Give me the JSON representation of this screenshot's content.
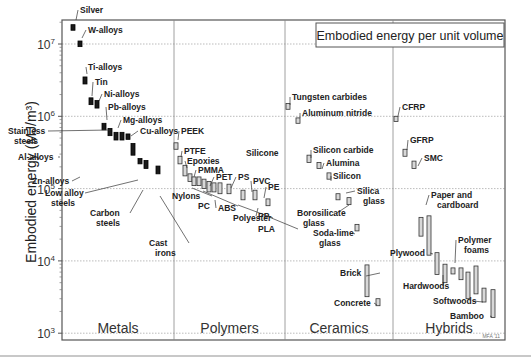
{
  "chart_data": {
    "type": "bar",
    "subtype": "log-range-bar",
    "title": "Embodied energy per unit volume",
    "ylabel": "Embodied energy (MJ/m³)",
    "xlabel": "",
    "yscale": "log",
    "ylim": [
      1000,
      20000000
    ],
    "yticks": [
      {
        "base": "10",
        "exp": "3",
        "value": 1000
      },
      {
        "base": "10",
        "exp": "4",
        "value": 10000
      },
      {
        "base": "10",
        "exp": "5",
        "value": 100000
      },
      {
        "base": "10",
        "exp": "6",
        "value": 1000000
      },
      {
        "base": "10",
        "exp": "7",
        "value": 10000000
      }
    ],
    "grid": true,
    "credit": "MFA '11",
    "categories": [
      "Metals",
      "Polymers",
      "Ceramics",
      "Hybrids"
    ],
    "series": [
      {
        "name": "Metals",
        "style": "solid",
        "materials": [
          {
            "label": "Silver",
            "x": 73,
            "lo": 15500000,
            "hi": 18500000,
            "lx": 80,
            "ly": 13,
            "tx": 76,
            "ty": 20
          },
          {
            "label": "W-alloys",
            "x": 80,
            "lo": 9200000,
            "hi": 11000000,
            "lx": 88,
            "ly": 33,
            "tx": 82,
            "ty": 38
          },
          {
            "label": "Ti-alloys",
            "x": 85,
            "lo": 2800000,
            "hi": 3500000,
            "lx": 88,
            "ly": 70,
            "tx": 87,
            "ty": 74
          },
          {
            "label": "Tin",
            "x": 91,
            "lo": 1450000,
            "hi": 1800000,
            "lx": 95,
            "ly": 85,
            "tx": 92,
            "ty": 96
          },
          {
            "label": "Ni-alloys",
            "x": 97,
            "lo": 1300000,
            "hi": 1650000,
            "lx": 104,
            "ly": 97,
            "tx": 99,
            "ty": 101
          },
          {
            "label": "Pb-alloys",
            "x": 104,
            "lo": 650000,
            "hi": 800000,
            "lx": 108,
            "ly": 110,
            "tx": 107,
            "ty": 120
          },
          {
            "label": "Stainless steels",
            "x": 110,
            "lo": 540000,
            "hi": 680000,
            "lx": 8,
            "ly": 134,
            "tx": 110,
            "ty": 130,
            "multiline": true
          },
          {
            "label": "Mg-alloys",
            "x": 116,
            "lo": 470000,
            "hi": 600000,
            "lx": 123,
            "ly": 123,
            "tx": 118,
            "ty": 128
          },
          {
            "label": "Al-alloys",
            "x": 122,
            "lo": 470000,
            "hi": 600000,
            "lx": 18,
            "ly": 160,
            "tx": 60,
            "ty": 157
          },
          {
            "label": "Cu-alloys",
            "x": 128,
            "lo": 480000,
            "hi": 570000,
            "lx": 140,
            "ly": 134,
            "tx": 131,
            "ty": 136
          },
          {
            "label": "Zn-alloys",
            "x": 133,
            "lo": 290000,
            "hi": 420000,
            "lx": 32,
            "ly": 184,
            "tx": 80,
            "ty": 177
          },
          {
            "label": "Low alloy steels",
            "x": 140,
            "lo": 220000,
            "hi": 260000,
            "lx": 45,
            "ly": 196,
            "tx": 138,
            "ty": 180,
            "multiline": true
          },
          {
            "label": "Carbon steels",
            "x": 146,
            "lo": 190000,
            "hi": 245000,
            "lx": 90,
            "ly": 216,
            "tx": 143,
            "ty": 190,
            "multiline": true
          },
          {
            "label": "Cast irons",
            "x": 158,
            "lo": 160000,
            "hi": 205000,
            "lx": 149,
            "ly": 246,
            "tx": 160,
            "ty": 196,
            "multiline": true
          }
        ]
      },
      {
        "name": "Polymers",
        "style": "hollow",
        "materials": [
          {
            "label": "PEEK",
            "x": 176,
            "lo": 350000,
            "hi": 430000,
            "lx": 181,
            "ly": 134,
            "tx": 178,
            "ty": 140
          },
          {
            "label": "PTFE",
            "x": 180,
            "lo": 220000,
            "hi": 280000,
            "lx": 184,
            "ly": 154,
            "tx": 181,
            "ty": 157
          },
          {
            "label": "Epoxies",
            "x": 185,
            "lo": 150000,
            "hi": 210000,
            "lx": 187,
            "ly": 164,
            "tx": 187,
            "ty": 168
          },
          {
            "label": "PMMA",
            "x": 190,
            "lo": 125000,
            "hi": 160000,
            "lx": 198,
            "ly": 173,
            "tx": 194,
            "ty": 177
          },
          {
            "label": "Nylons",
            "x": 194,
            "lo": 110000,
            "hi": 145000,
            "lx": 172,
            "ly": 199,
            "tx": 192,
            "ty": 188
          },
          {
            "label": "PC",
            "x": 199,
            "lo": 110000,
            "hi": 145000,
            "lx": 198,
            "ly": 209,
            "tx": 203,
            "ty": 191
          },
          {
            "label": "PET",
            "x": 204,
            "lo": 100000,
            "hi": 135000,
            "lx": 216,
            "ly": 180,
            "tx": 210,
            "ty": 186
          },
          {
            "label": "ABS",
            "x": 209,
            "lo": 90000,
            "hi": 125000,
            "lx": 218,
            "ly": 211,
            "tx": 215,
            "ty": 200
          },
          {
            "label": "PS",
            "x": 214,
            "lo": 90000,
            "hi": 120000,
            "lx": 238,
            "ly": 180,
            "tx": 231,
            "ty": 188
          },
          {
            "label": "Polyester",
            "x": 220,
            "lo": 85000,
            "hi": 120000,
            "lx": 233,
            "ly": 221,
            "tx": 238,
            "ty": 205
          },
          {
            "label": "PVC",
            "x": 229,
            "lo": 85000,
            "hi": 115000,
            "lx": 253,
            "ly": 184,
            "tx": 252,
            "ty": 192
          },
          {
            "label": "PP",
            "x": 243,
            "lo": 70000,
            "hi": 95000,
            "lx": 258,
            "ly": 219,
            "tx": 258,
            "ty": 208
          },
          {
            "label": "PE",
            "x": 255,
            "lo": 70000,
            "hi": 95000,
            "lx": 268,
            "ly": 190,
            "tx": 264,
            "ty": 198
          },
          {
            "label": "PLA",
            "x": 268,
            "lo": 58000,
            "hi": 72000,
            "lx": 258,
            "ly": 232,
            "tx": 269,
            "ty": 217
          },
          {
            "label": "Silicone",
            "x": 0,
            "lo": 0,
            "hi": 0,
            "lx": 246,
            "ly": 156,
            "tx": 0,
            "ty": 0,
            "nobar": true
          }
        ]
      },
      {
        "name": "Ceramics",
        "style": "hollow",
        "materials": [
          {
            "label": "Tungsten carbides",
            "x": 288,
            "lo": 1250000,
            "hi": 1500000,
            "lx": 292,
            "ly": 100,
            "tx": 290,
            "ty": 105
          },
          {
            "label": "Aluminum nitride",
            "x": 298,
            "lo": 800000,
            "hi": 950000,
            "lx": 302,
            "ly": 116,
            "tx": 300,
            "ty": 118
          },
          {
            "label": "Silicon carbide",
            "x": 309,
            "lo": 230000,
            "hi": 290000,
            "lx": 313,
            "ly": 153,
            "tx": 311,
            "ty": 158
          },
          {
            "label": "Alumina",
            "x": 319,
            "lo": 190000,
            "hi": 230000,
            "lx": 326,
            "ly": 166,
            "tx": 322,
            "ty": 169
          },
          {
            "label": "Silicon",
            "x": 329,
            "lo": 135000,
            "hi": 165000,
            "lx": 333,
            "ly": 179,
            "tx": 331,
            "ty": 181
          },
          {
            "label": "Silica glass",
            "x": 338,
            "lo": 70000,
            "hi": 85000,
            "lx": 357,
            "ly": 194,
            "tx": 346,
            "ty": 193,
            "multiline": true
          },
          {
            "label": "Borosilicate glass",
            "x": 349,
            "lo": 60000,
            "hi": 75000,
            "lx": 297,
            "ly": 216,
            "tx": 349,
            "ty": 205,
            "multiline": true
          },
          {
            "label": "Soda-lime glass",
            "x": 357,
            "lo": 26000,
            "hi": 32000,
            "lx": 313,
            "ly": 236,
            "tx": 355,
            "ty": 234,
            "multiline": true
          },
          {
            "label": "Brick",
            "x": 367,
            "lo": 3200000,
            "hi": 8800,
            "lx": 340,
            "ly": 276,
            "tx": 366,
            "ty": 276,
            "range": [
              3200,
              8800
            ]
          },
          {
            "label": "Concrete",
            "x": 378,
            "lo": 2400,
            "hi": 3000,
            "lx": 334,
            "ly": 306,
            "tx": 377,
            "ty": 305
          }
        ]
      },
      {
        "name": "Hybrids",
        "style": "hollow",
        "materials": [
          {
            "label": "CFRP",
            "x": 396,
            "lo": 850000,
            "hi": 1000000,
            "lx": 402,
            "ly": 110,
            "tx": 398,
            "ty": 116
          },
          {
            "label": "GFRP",
            "x": 405,
            "lo": 280000,
            "hi": 350000,
            "lx": 410,
            "ly": 143,
            "tx": 407,
            "ty": 150
          },
          {
            "label": "SMC",
            "x": 414,
            "lo": 190000,
            "hi": 240000,
            "lx": 424,
            "ly": 161,
            "tx": 418,
            "ty": 166
          },
          {
            "label": "Paper and cardboard",
            "x": 421,
            "lo": 22000,
            "hi": 40000,
            "lx": 431,
            "ly": 198,
            "tx": 426,
            "ty": 205,
            "multiline": true
          },
          {
            "label": "Paper and cardboard (2)",
            "x": 429,
            "lo": 12000,
            "hi": 42000,
            "lx": 0,
            "ly": 0,
            "tx": 0,
            "ty": 0,
            "nolabel": true
          },
          {
            "label": "Plywood",
            "x": 437,
            "lo": 6500,
            "hi": 13000,
            "lx": 390,
            "ly": 256,
            "tx": 433,
            "ty": 254
          },
          {
            "label": "Hardwoods",
            "x": 445,
            "lo": 5000,
            "hi": 9000,
            "lx": 403,
            "ly": 289,
            "tx": 443,
            "ty": 275
          },
          {
            "label": "Polymer foams",
            "x": 453,
            "lo": 6600,
            "hi": 8000,
            "lx": 458,
            "ly": 243,
            "tx": 455,
            "ty": 263,
            "multiline": true
          },
          {
            "label": "Polymer foams (2)",
            "x": 461,
            "lo": 5500,
            "hi": 8000,
            "lx": 0,
            "ly": 0,
            "tx": 0,
            "ty": 0,
            "nolabel": true
          },
          {
            "label": "Polymer foams (3)",
            "x": 468,
            "lo": 3000,
            "hi": 7000,
            "lx": 0,
            "ly": 0,
            "tx": 0,
            "ty": 0,
            "nolabel": true
          },
          {
            "label": "Softwoods (tall)",
            "x": 476,
            "lo": 3500,
            "hi": 8500,
            "lx": 0,
            "ly": 0,
            "tx": 0,
            "ty": 0,
            "nolabel": true
          },
          {
            "label": "Softwoods",
            "x": 484,
            "lo": 2700,
            "hi": 4200,
            "lx": 433,
            "ly": 304,
            "tx": 483,
            "ty": 302
          },
          {
            "label": "Bamboo",
            "x": 493,
            "lo": 1650000,
            "hi": 4000,
            "lx": 450,
            "ly": 319,
            "tx": 492,
            "ty": 317,
            "range": [
              1650,
              4000
            ]
          }
        ]
      }
    ]
  }
}
